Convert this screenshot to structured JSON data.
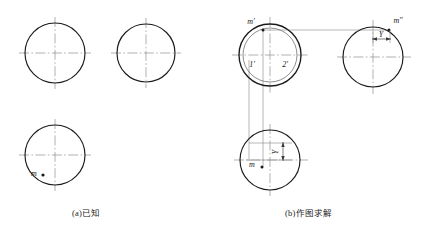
{
  "figure": {
    "background_color": "#ffffff",
    "outline_color": "#1a1a1a",
    "centerline_color": "#8a8a8a",
    "projection_line_color": "#8a8a8a",
    "label_color": "#1a1a1a"
  },
  "panels": [
    {
      "id": "a",
      "caption": "(a)已知",
      "views": [
        {
          "name": "front-view",
          "shape": "circle",
          "center_x": 55,
          "center_y": 53,
          "radius": 30,
          "centerlines": true,
          "labels": []
        },
        {
          "name": "side-view",
          "shape": "circle",
          "center_x": 146,
          "center_y": 53,
          "radius": 29,
          "centerlines": true,
          "labels": []
        },
        {
          "name": "top-view",
          "shape": "circle",
          "center_x": 55,
          "center_y": 155,
          "radius": 30,
          "centerlines": true,
          "labels": [
            {
              "text": "m",
              "x": 34,
              "y": 173,
              "point_x": 43,
              "point_y": 175
            }
          ]
        }
      ]
    },
    {
      "id": "b",
      "caption": "(b)作图求解",
      "views": [
        {
          "name": "front-view",
          "shape": "double-circle",
          "center_x": 270,
          "center_y": 55,
          "radius": 31,
          "inner_radius": 27,
          "centerlines": true,
          "labels": [
            {
              "text": "m′",
              "x": 249,
              "y": 23,
              "point_x": 263,
              "point_y": 30
            },
            {
              "text": "1′",
              "x": 250,
              "y": 64
            },
            {
              "text": "2′",
              "x": 283,
              "y": 64
            }
          ]
        },
        {
          "name": "side-view",
          "shape": "circle",
          "center_x": 373,
          "center_y": 57,
          "radius": 30,
          "centerlines": true,
          "labels": [
            {
              "text": "m″",
              "x": 395,
              "y": 22,
              "point_x": 387,
              "point_y": 30
            }
          ],
          "dimension": {
            "text": "Y",
            "orientation": "horizontal",
            "x1": 373,
            "x2": 390,
            "y": 37
          }
        },
        {
          "name": "top-view",
          "shape": "circle",
          "center_x": 270,
          "center_y": 160,
          "radius": 30,
          "centerlines": true,
          "labels": [
            {
              "text": "m",
              "x": 251,
              "y": 165,
              "point_x": 262,
              "point_y": 166
            }
          ],
          "dimension": {
            "text": "Y",
            "orientation": "vertical",
            "y1": 143,
            "y2": 160,
            "x": 281
          }
        }
      ],
      "projection_lines": [
        {
          "name": "horizontal-m-to-m-double-prime",
          "x1": 263,
          "y1": 30,
          "x2": 390,
          "y2": 30
        },
        {
          "name": "vertical-m-prime-down",
          "x1": 263,
          "y1": 30,
          "x2": 263,
          "y2": 167
        },
        {
          "name": "vertical-left-extension-down",
          "x1": 249,
          "y1": 62,
          "x2": 249,
          "y2": 160
        },
        {
          "name": "horizontal-top-view-extension",
          "x1": 249,
          "y1": 160,
          "x2": 290,
          "y2": 160
        },
        {
          "name": "horizontal-top-view-upper",
          "x1": 249,
          "y1": 143,
          "x2": 290,
          "y2": 143
        }
      ]
    }
  ]
}
